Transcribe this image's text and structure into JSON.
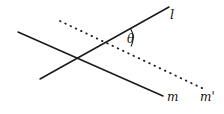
{
  "figure": {
    "type": "geometry-diagram",
    "background_color": "#ffffff",
    "stroke_color": "#1a1a1a",
    "labels": {
      "line_l": "l",
      "line_m": "m",
      "line_m_prime": "m'",
      "angle": "θ"
    },
    "geometry": {
      "line_l": {
        "x1": 40,
        "y1": 79,
        "x2": 169,
        "y2": 7,
        "style": "solid"
      },
      "line_m": {
        "x1": 18,
        "y1": 32,
        "x2": 163,
        "y2": 96,
        "style": "solid"
      },
      "line_m_prime": {
        "x1": 60,
        "y1": 21,
        "x2": 206,
        "y2": 90,
        "style": "dotted"
      },
      "intersection_l_m": {
        "x": 75,
        "y": 63
      },
      "intersection_l_mprime": {
        "x": 113,
        "y": 38
      },
      "angle_arc": {
        "cx": 113,
        "cy": 38,
        "radius": 20
      }
    }
  }
}
